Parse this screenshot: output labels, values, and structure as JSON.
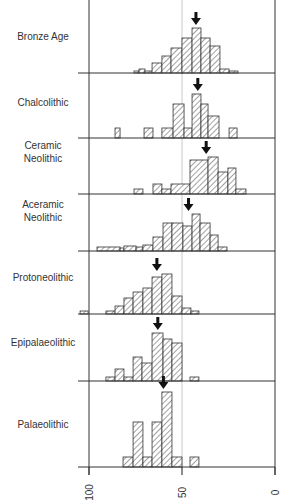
{
  "chart_data": {
    "type": "bar",
    "subtype": "stacked-panel histograms",
    "title": "",
    "xlabel": "",
    "ylabel": "",
    "x_axis": {
      "reversed": true,
      "range": [
        100,
        0
      ],
      "ticks": [
        100,
        50,
        0
      ],
      "tick_labels": [
        "100",
        "50",
        "0"
      ],
      "reference_line": 50
    },
    "geometry": {
      "x_px_at_100": 89,
      "x_px_at_0": 275,
      "left_ext_px": 78,
      "height_scale_px_per_unit": 1
    },
    "panels": [
      {
        "name": "Bronze Age",
        "label_lines": [
          "Bronze Age"
        ],
        "baseline_px": 73,
        "label_y_px": 36,
        "arrow_value": 42.5,
        "bins": [
          [
            75.8,
            73.1,
            2
          ],
          [
            73.1,
            69.9,
            4
          ],
          [
            69.9,
            66.1,
            2
          ],
          [
            66.1,
            60.8,
            10
          ],
          [
            60.8,
            55.9,
            17
          ],
          [
            55.9,
            50.0,
            25
          ],
          [
            50.0,
            44.6,
            35
          ],
          [
            44.6,
            39.8,
            45
          ],
          [
            39.8,
            34.9,
            35
          ],
          [
            34.9,
            29.6,
            27
          ],
          [
            29.6,
            24.7,
            4
          ],
          [
            24.7,
            19.9,
            2
          ]
        ]
      },
      {
        "name": "Chalcolithic",
        "label_lines": [
          "Chalcolithic"
        ],
        "baseline_px": 138,
        "label_y_px": 102,
        "arrow_value": 41.5,
        "bins": [
          [
            86.0,
            83.3,
            10
          ],
          [
            70.4,
            65.6,
            10
          ],
          [
            60.8,
            54.8,
            10
          ],
          [
            54.8,
            48.9,
            34
          ],
          [
            48.9,
            44.6,
            10
          ],
          [
            44.6,
            39.8,
            44
          ],
          [
            39.8,
            36.0,
            34
          ],
          [
            36.0,
            30.1,
            22
          ],
          [
            24.7,
            20.4,
            10
          ]
        ]
      },
      {
        "name": "Ceramic Neolithic",
        "label_lines": [
          "Ceramic",
          "Neolithic"
        ],
        "baseline_px": 194,
        "label_y_px": 152,
        "arrow_value": 37,
        "bins": [
          [
            75.8,
            71.0,
            5
          ],
          [
            65.6,
            60.8,
            10
          ],
          [
            60.8,
            55.9,
            5
          ],
          [
            55.9,
            45.7,
            10
          ],
          [
            45.7,
            36.0,
            34
          ],
          [
            36.0,
            30.6,
            37
          ],
          [
            30.6,
            25.3,
            22
          ],
          [
            25.3,
            21.0,
            26
          ],
          [
            21.0,
            15.6,
            5
          ]
        ]
      },
      {
        "name": "Aceramic Neolithic",
        "label_lines": [
          "Aceramic",
          "Neolithic"
        ],
        "baseline_px": 251,
        "label_y_px": 211,
        "arrow_value": 46.5,
        "bins": [
          [
            95.7,
            83.3,
            4
          ],
          [
            83.3,
            81.2,
            3
          ],
          [
            81.2,
            74.7,
            5
          ],
          [
            74.7,
            71.0,
            4
          ],
          [
            71.0,
            65.6,
            6
          ],
          [
            65.6,
            60.2,
            14
          ],
          [
            60.2,
            55.4,
            28
          ],
          [
            55.4,
            49.5,
            28
          ],
          [
            49.5,
            44.6,
            25
          ],
          [
            44.6,
            40.3,
            37
          ],
          [
            40.3,
            34.9,
            28
          ],
          [
            34.9,
            30.6,
            16
          ],
          [
            30.6,
            25.8,
            4
          ]
        ]
      },
      {
        "name": "Protoneolithic",
        "label_lines": [
          "Protoneolithic"
        ],
        "baseline_px": 314,
        "label_y_px": 277,
        "arrow_value": 63.5,
        "bins": [
          [
            104.8,
            100.5,
            3
          ],
          [
            90.9,
            86.0,
            3
          ],
          [
            86.0,
            81.2,
            8
          ],
          [
            81.2,
            76.3,
            16
          ],
          [
            76.3,
            71.0,
            22
          ],
          [
            71.0,
            66.1,
            26
          ],
          [
            66.1,
            60.8,
            37
          ],
          [
            60.8,
            55.4,
            40
          ],
          [
            55.4,
            50.0,
            18
          ],
          [
            50.0,
            45.2,
            6
          ],
          [
            45.2,
            40.9,
            3
          ]
        ]
      },
      {
        "name": "Epipalaeolithic",
        "label_lines": [
          "Epipalaeolithic"
        ],
        "baseline_px": 381,
        "label_y_px": 342,
        "arrow_value": 63,
        "bins": [
          [
            90.9,
            86.0,
            4
          ],
          [
            86.0,
            81.2,
            12
          ],
          [
            81.2,
            76.3,
            4
          ],
          [
            76.3,
            71.5,
            24
          ],
          [
            71.5,
            66.1,
            18
          ],
          [
            66.1,
            60.2,
            48
          ],
          [
            60.2,
            55.4,
            42
          ],
          [
            55.4,
            50.0,
            38
          ],
          [
            45.7,
            40.9,
            4
          ]
        ]
      },
      {
        "name": "Palaeolithic",
        "label_lines": [
          "Palaeolithic"
        ],
        "baseline_px": 467,
        "label_y_px": 424,
        "arrow_value": 60,
        "bins": [
          [
            81.7,
            76.3,
            10
          ],
          [
            76.3,
            71.0,
            45
          ],
          [
            71.0,
            66.1,
            10
          ],
          [
            66.1,
            60.8,
            45
          ],
          [
            60.8,
            55.4,
            75
          ],
          [
            55.4,
            50.0,
            10
          ],
          [
            45.7,
            40.9,
            10
          ]
        ]
      }
    ],
    "legend": null,
    "grid": false
  },
  "colors": {
    "line": "#333333",
    "hatch": "#444444",
    "reference": "#bbbbbb",
    "fill": "#ffffff"
  }
}
